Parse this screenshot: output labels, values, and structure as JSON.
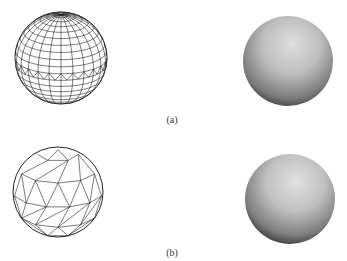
{
  "figure": {
    "panels": [
      {
        "id": "a",
        "label": "(a)",
        "wireframe": {
          "type": "uv-sphere",
          "cx": 61,
          "cy": 58,
          "r": 46,
          "latitudes": 20,
          "longitudes": 24,
          "seam": "zigzag-equator"
        },
        "shaded": {
          "cx": 288,
          "cy": 61,
          "r": 45
        }
      },
      {
        "id": "b",
        "label": "(b)",
        "wireframe": {
          "type": "low-poly-triangulated-sphere",
          "cx": 58,
          "cy": 192,
          "r": 45
        },
        "shaded": {
          "cx": 290,
          "cy": 199,
          "r": 45
        }
      }
    ],
    "colors": {
      "line": "#222222",
      "shade_light": "#d8d8d8",
      "shade_dark": "#3a3a3a",
      "background": "#ffffff"
    }
  }
}
